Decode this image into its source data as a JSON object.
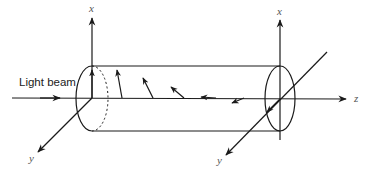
{
  "diagram": {
    "title": "",
    "labels": {
      "light_beam": "Light beam",
      "left_x_axis": "x",
      "left_y_axis": "y",
      "right_x_axis": "x",
      "right_y_axis": "y",
      "z_axis": "z"
    },
    "colors": {
      "stroke": "#1a1a1a",
      "background": "#ffffff",
      "label": "#555555"
    },
    "polarization_arrows": [
      {
        "base_x": 92,
        "angle_deg": 90
      },
      {
        "base_x": 122,
        "angle_deg": 80
      },
      {
        "base_x": 153,
        "angle_deg": 60
      },
      {
        "base_x": 181,
        "angle_deg": 40
      },
      {
        "base_x": 214,
        "angle_deg": 5
      },
      {
        "base_x": 247,
        "angle_deg": -20
      }
    ]
  }
}
